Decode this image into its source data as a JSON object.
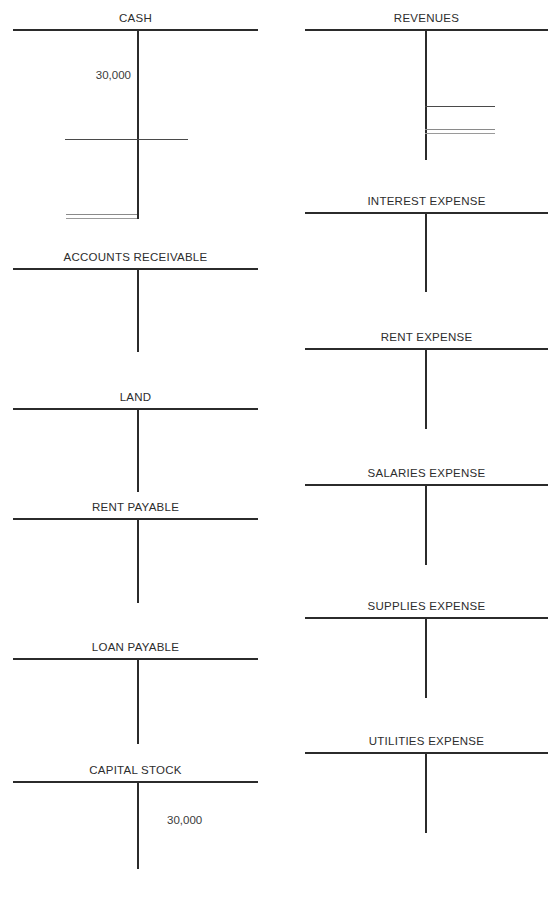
{
  "page": {
    "background": "#ffffff",
    "ink": "#2b2b2b",
    "width": 555,
    "height": 910
  },
  "columns": {
    "left": {
      "x": 13,
      "width": 245,
      "stem_offset": 124
    },
    "right": {
      "x": 305,
      "width": 243,
      "stem_offset": 120
    }
  },
  "accounts": [
    {
      "id": "cash",
      "name": "CASH",
      "column": "left",
      "top": 29,
      "stem_height": 190,
      "entries": [
        {
          "side": "debit",
          "value": "30,000",
          "y": 40
        }
      ],
      "rules": [
        {
          "kind": "subtotal",
          "span": "both",
          "y": 110,
          "left": 52,
          "right": 70
        },
        {
          "kind": "total",
          "span": "debit",
          "y": 185,
          "left": 53,
          "right": 0
        }
      ]
    },
    {
      "id": "accounts-receivable",
      "name": "ACCOUNTS RECEIVABLE",
      "column": "left",
      "top": 268,
      "stem_height": 84,
      "entries": [],
      "rules": []
    },
    {
      "id": "land",
      "name": "LAND",
      "column": "left",
      "top": 408,
      "stem_height": 84,
      "entries": [],
      "rules": []
    },
    {
      "id": "rent-payable",
      "name": "RENT PAYABLE",
      "column": "left",
      "top": 518,
      "stem_height": 85,
      "entries": [],
      "rules": []
    },
    {
      "id": "loan-payable",
      "name": "LOAN PAYABLE",
      "column": "left",
      "top": 658,
      "stem_height": 86,
      "entries": [],
      "rules": []
    },
    {
      "id": "capital-stock",
      "name": "CAPITAL STOCK",
      "column": "left",
      "top": 781,
      "stem_height": 88,
      "entries": [
        {
          "side": "credit",
          "value": "30,000",
          "y": 33
        }
      ],
      "rules": []
    },
    {
      "id": "revenues",
      "name": "REVENUES",
      "column": "right",
      "top": 29,
      "stem_height": 131,
      "entries": [],
      "rules": [
        {
          "kind": "subtotal",
          "span": "credit",
          "y": 77,
          "left": 0,
          "right": 53
        },
        {
          "kind": "total",
          "span": "credit",
          "y": 100,
          "left": 0,
          "right": 53
        }
      ]
    },
    {
      "id": "interest-expense",
      "name": "INTEREST EXPENSE",
      "column": "right",
      "top": 212,
      "stem_height": 80,
      "entries": [],
      "rules": []
    },
    {
      "id": "rent-expense",
      "name": "RENT EXPENSE",
      "column": "right",
      "top": 348,
      "stem_height": 81,
      "entries": [],
      "rules": []
    },
    {
      "id": "salaries-expense",
      "name": "SALARIES EXPENSE",
      "column": "right",
      "top": 484,
      "stem_height": 81,
      "entries": [],
      "rules": []
    },
    {
      "id": "supplies-expense",
      "name": "SUPPLIES EXPENSE",
      "column": "right",
      "top": 617,
      "stem_height": 81,
      "entries": [],
      "rules": []
    },
    {
      "id": "utilities-expense",
      "name": "UTILITIES EXPENSE",
      "column": "right",
      "top": 752,
      "stem_height": 81,
      "entries": [],
      "rules": []
    }
  ]
}
